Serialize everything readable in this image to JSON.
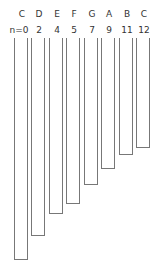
{
  "tubes": [
    {
      "note": "C",
      "n": "n=0",
      "left": 14,
      "bottom": 260
    },
    {
      "note": "D",
      "n": "2",
      "left": 31,
      "bottom": 236
    },
    {
      "note": "E",
      "n": "4",
      "left": 49,
      "bottom": 214
    },
    {
      "note": "F",
      "n": "5",
      "left": 66,
      "bottom": 204
    },
    {
      "note": "G",
      "n": "7",
      "left": 84,
      "bottom": 185
    },
    {
      "note": "A",
      "n": "9",
      "left": 101,
      "bottom": 169
    },
    {
      "note": "B",
      "n": "11",
      "left": 119,
      "bottom": 155
    },
    {
      "note": "C",
      "n": "12",
      "left": 136,
      "bottom": 148
    }
  ],
  "colors": {
    "stroke": "#777777",
    "text": "#333333",
    "background": "#ffffff"
  }
}
